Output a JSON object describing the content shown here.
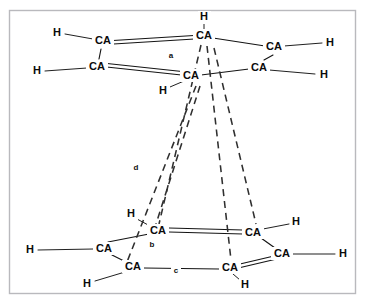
{
  "figure": {
    "background_color": "#ffffff",
    "frame_color": "#b9b9bd",
    "bond_color": "#141414",
    "hbond_color": "#2f2f2f",
    "label_color": "#0b0b0b",
    "frame": {
      "x": 9,
      "y": 10,
      "width": 347,
      "height": 284
    }
  },
  "atoms": {
    "upper_ring": [
      {
        "id": "u-ca-1",
        "label": "CA",
        "x": 103,
        "y": 41
      },
      {
        "id": "u-ca-2",
        "label": "CA",
        "x": 204,
        "y": 36
      },
      {
        "id": "u-ca-3",
        "label": "CA",
        "x": 274,
        "y": 47
      },
      {
        "id": "u-ca-4",
        "label": "CA",
        "x": 259,
        "y": 68
      },
      {
        "id": "u-ca-5",
        "label": "CA",
        "x": 191,
        "y": 76
      },
      {
        "id": "u-ca-6",
        "label": "CA",
        "x": 97,
        "y": 67
      }
    ],
    "upper_hydrogens": [
      {
        "id": "u-h-1",
        "label": "H",
        "x": 57,
        "y": 33
      },
      {
        "id": "u-h-2",
        "label": "H",
        "x": 204,
        "y": 17
      },
      {
        "id": "u-h-3",
        "label": "H",
        "x": 330,
        "y": 43
      },
      {
        "id": "u-h-4",
        "label": "H",
        "x": 324,
        "y": 75
      },
      {
        "id": "u-h-5",
        "label": "H",
        "x": 163,
        "y": 91
      },
      {
        "id": "u-h-6",
        "label": "H",
        "x": 37,
        "y": 71
      }
    ],
    "lower_ring": [
      {
        "id": "l-ca-1",
        "label": "CA",
        "x": 158,
        "y": 231
      },
      {
        "id": "l-ca-2",
        "label": "CA",
        "x": 253,
        "y": 233
      },
      {
        "id": "l-ca-3",
        "label": "CA",
        "x": 282,
        "y": 254
      },
      {
        "id": "l-ca-4",
        "label": "CA",
        "x": 230,
        "y": 268
      },
      {
        "id": "l-ca-5",
        "label": "CA",
        "x": 133,
        "y": 267
      },
      {
        "id": "l-ca-6",
        "label": "CA",
        "x": 104,
        "y": 249
      }
    ],
    "lower_hydrogens": [
      {
        "id": "l-h-1",
        "label": "H",
        "x": 131,
        "y": 214
      },
      {
        "id": "l-h-2",
        "label": "H",
        "x": 296,
        "y": 222
      },
      {
        "id": "l-h-3",
        "label": "H",
        "x": 343,
        "y": 254
      },
      {
        "id": "l-h-4",
        "label": "H",
        "x": 245,
        "y": 285
      },
      {
        "id": "l-h-5",
        "label": "H",
        "x": 87,
        "y": 284
      },
      {
        "id": "l-h-6",
        "label": "H",
        "x": 30,
        "y": 250
      }
    ]
  },
  "bonds": {
    "upper_ring_bonds": [
      {
        "from": [
          113,
          41
        ],
        "to": [
          194,
          36
        ],
        "order": 2
      },
      {
        "from": [
          213,
          38
        ],
        "to": [
          265,
          47
        ],
        "order": 1
      },
      {
        "from": [
          272,
          55
        ],
        "to": [
          264,
          61
        ],
        "order": 1
      },
      {
        "from": [
          249,
          69
        ],
        "to": [
          200,
          75
        ],
        "order": 1
      },
      {
        "from": [
          182,
          74
        ],
        "to": [
          107,
          66
        ],
        "order": 2
      },
      {
        "from": [
          99,
          59
        ],
        "to": [
          100,
          49
        ],
        "order": 1
      }
    ],
    "upper_h_bonds": [
      {
        "from": [
          65,
          34
        ],
        "to": [
          93,
          40
        ]
      },
      {
        "from": [
          204,
          24
        ],
        "to": [
          204,
          30
        ]
      },
      {
        "from": [
          284,
          46
        ],
        "to": [
          322,
          43
        ]
      },
      {
        "from": [
          269,
          69
        ],
        "to": [
          315,
          74
        ]
      },
      {
        "from": [
          183,
          81
        ],
        "to": [
          170,
          88
        ]
      },
      {
        "from": [
          45,
          71
        ],
        "to": [
          87,
          68
        ]
      }
    ],
    "lower_ring_bonds": [
      {
        "from": [
          169,
          231
        ],
        "to": [
          243,
          233
        ],
        "order": 2
      },
      {
        "from": [
          261,
          237
        ],
        "to": [
          275,
          248
        ],
        "order": 1
      },
      {
        "from": [
          275,
          257
        ],
        "to": [
          240,
          266
        ],
        "order": 2
      },
      {
        "from": [
          219,
          269
        ],
        "to": [
          144,
          268
        ],
        "order": 1
      },
      {
        "from": [
          126,
          262
        ],
        "to": [
          111,
          254
        ],
        "order": 1
      },
      {
        "from": [
          107,
          242
        ],
        "to": [
          150,
          234
        ],
        "order": 1
      }
    ],
    "lower_h_bonds": [
      {
        "from": [
          137,
          219
        ],
        "to": [
          150,
          226
        ]
      },
      {
        "from": [
          288,
          224
        ],
        "to": [
          263,
          229
        ]
      },
      {
        "from": [
          292,
          254
        ],
        "to": [
          335,
          254
        ]
      },
      {
        "from": [
          239,
          280
        ],
        "to": [
          232,
          274
        ]
      },
      {
        "from": [
          95,
          282
        ],
        "to": [
          125,
          272
        ]
      },
      {
        "from": [
          38,
          250
        ],
        "to": [
          95,
          249
        ]
      }
    ]
  },
  "hydrogen_bonds": [
    {
      "id": "hbond-a",
      "from": [
        203,
        44
      ],
      "to": [
        160,
        226
      ],
      "label": "a",
      "label_x": 171,
      "label_y": 56
    },
    {
      "id": "hbond-d",
      "from": [
        196,
        84
      ],
      "to": [
        126,
        265
      ],
      "label": "d",
      "label_x": 136,
      "label_y": 168
    },
    {
      "id": "hbond-b",
      "from": [
        199,
        84
      ],
      "to": [
        157,
        240
      ],
      "label": "b",
      "label_x": 152,
      "label_y": 245
    },
    {
      "id": "hbond-c",
      "from": [
        206,
        45
      ],
      "to": [
        231,
        261
      ],
      "label": "c",
      "label_x": 176,
      "label_y": 271
    },
    {
      "id": "hbond-e",
      "from": [
        213,
        47
      ],
      "to": [
        255,
        226
      ],
      "label": "",
      "label_x": 0,
      "label_y": 0
    }
  ],
  "distance_labels": [
    {
      "id": "label-a",
      "text": "a"
    },
    {
      "id": "label-b",
      "text": "b"
    },
    {
      "id": "label-c",
      "text": "c"
    },
    {
      "id": "label-d",
      "text": "d"
    }
  ]
}
